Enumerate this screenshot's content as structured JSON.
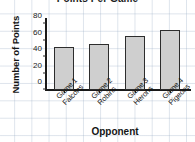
{
  "chart_data": {
    "type": "bar",
    "title": "Points Per Game",
    "xlabel": "Opponent",
    "ylabel": "Number of Points",
    "categories": [
      "Game 1 Falcons",
      "Game 2 Robins",
      "Game 3 Herons",
      "Game 4 Pigeons"
    ],
    "category_lines": [
      {
        "line1": "Game 1",
        "line2": "Falcons"
      },
      {
        "line1": "Game 2",
        "line2": "Robins"
      },
      {
        "line1": "Game 3",
        "line2": "Herons"
      },
      {
        "line1": "Game 4",
        "line2": "Pigeons"
      }
    ],
    "values": [
      52,
      56,
      65,
      73
    ],
    "ylim": [
      0,
      85
    ],
    "yticks": [
      0,
      20,
      40,
      60,
      80
    ],
    "ytick_labels": [
      "0",
      "20",
      "40",
      "60",
      "80"
    ],
    "grid": true,
    "legend": "none",
    "bar_fill": "#cfcfcf",
    "bar_edge": "#2d2d2d",
    "axis_color": "#191919",
    "grid_color": "#96aac3"
  }
}
